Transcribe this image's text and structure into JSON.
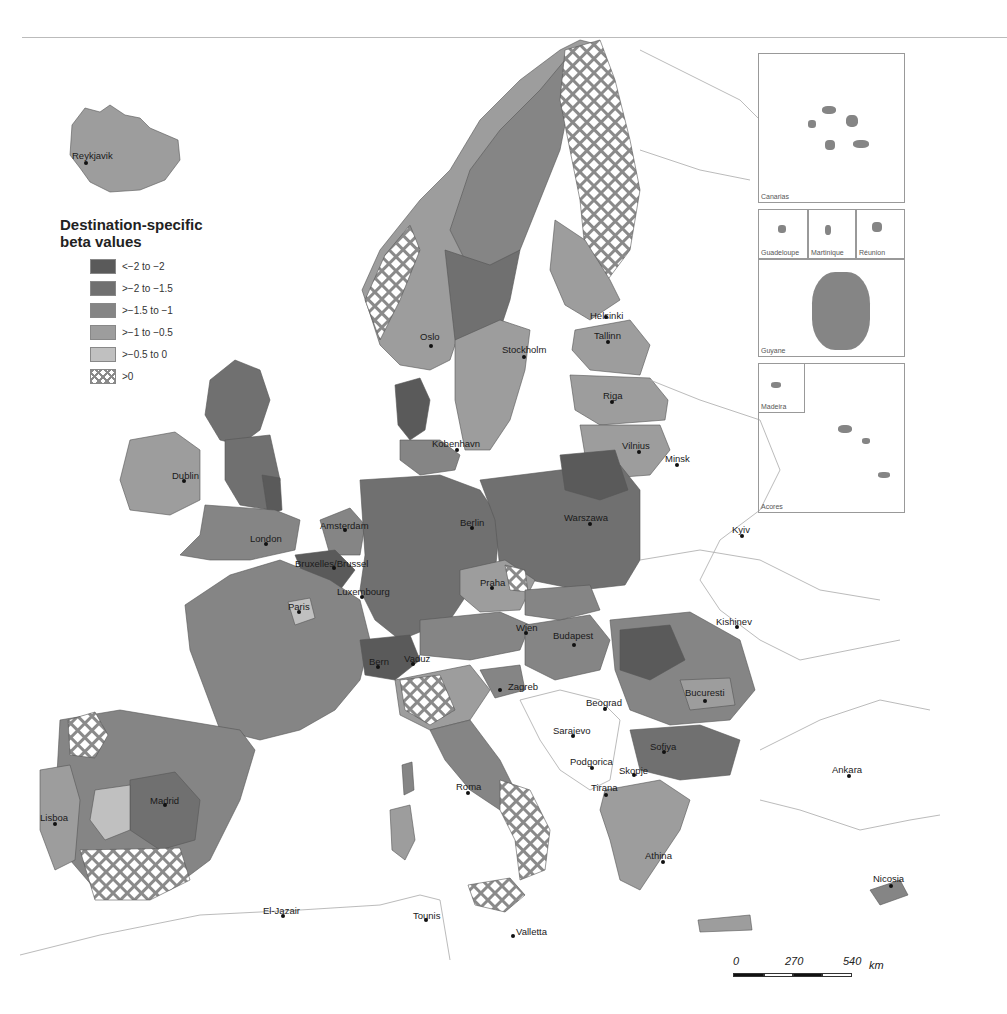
{
  "legend": {
    "title_line1": "Destination-specific",
    "title_line2": "beta values",
    "items": [
      {
        "label": "<−2 to −2",
        "color": "#5a5a5a"
      },
      {
        "label": ">−2 to −1.5",
        "color": "#707070"
      },
      {
        "label": ">−1.5 to −1",
        "color": "#858585"
      },
      {
        "label": ">−1 to −0.5",
        "color": "#9d9d9d"
      },
      {
        "label": ">−0.5 to 0",
        "color": "#c0c0c0"
      },
      {
        "label": ">0",
        "color": "crosshatch"
      }
    ]
  },
  "cities": [
    {
      "name": "Reykjavik",
      "x": 72,
      "y": 150,
      "dx": 86,
      "dy": 163
    },
    {
      "name": "Oslo",
      "x": 420,
      "y": 331,
      "dx": 431,
      "dy": 346
    },
    {
      "name": "Stockholm",
      "x": 502,
      "y": 344,
      "dx": 524,
      "dy": 357
    },
    {
      "name": "Helsinki",
      "x": 590,
      "y": 310,
      "dx": 606,
      "dy": 317
    },
    {
      "name": "Tallinn",
      "x": 594,
      "y": 330,
      "dx": 608,
      "dy": 342
    },
    {
      "name": "Riga",
      "x": 603,
      "y": 390,
      "dx": 612,
      "dy": 402
    },
    {
      "name": "Vilnius",
      "x": 622,
      "y": 440,
      "dx": 639,
      "dy": 452
    },
    {
      "name": "Minsk",
      "x": 665,
      "y": 453,
      "dx": 677,
      "dy": 465
    },
    {
      "name": "Kobenhavn",
      "x": 432,
      "y": 438,
      "dx": 457,
      "dy": 450
    },
    {
      "name": "Dublin",
      "x": 172,
      "y": 470,
      "dx": 184,
      "dy": 481
    },
    {
      "name": "London",
      "x": 250,
      "y": 533,
      "dx": 266,
      "dy": 544
    },
    {
      "name": "Amsterdam",
      "x": 320,
      "y": 520,
      "dx": 345,
      "dy": 530
    },
    {
      "name": "Berlin",
      "x": 460,
      "y": 517,
      "dx": 472,
      "dy": 528
    },
    {
      "name": "Warszawa",
      "x": 564,
      "y": 512,
      "dx": 590,
      "dy": 524
    },
    {
      "name": "Kyiv",
      "x": 732,
      "y": 524,
      "dx": 742,
      "dy": 536
    },
    {
      "name": "Bruxelles/Brussel",
      "x": 295,
      "y": 558,
      "dx": 334,
      "dy": 568
    },
    {
      "name": "Luxembourg",
      "x": 337,
      "y": 586,
      "dx": 362,
      "dy": 597
    },
    {
      "name": "Paris",
      "x": 288,
      "y": 601,
      "dx": 299,
      "dy": 612
    },
    {
      "name": "Praha",
      "x": 480,
      "y": 577,
      "dx": 492,
      "dy": 588
    },
    {
      "name": "Wien",
      "x": 516,
      "y": 622,
      "dx": 526,
      "dy": 633
    },
    {
      "name": "Budapest",
      "x": 553,
      "y": 630,
      "dx": 574,
      "dy": 645
    },
    {
      "name": "Kishinev",
      "x": 716,
      "y": 616,
      "dx": 737,
      "dy": 627
    },
    {
      "name": "Bern",
      "x": 369,
      "y": 656,
      "dx": 378,
      "dy": 667
    },
    {
      "name": "Vaduz",
      "x": 404,
      "y": 653,
      "dx": 413,
      "dy": 664
    },
    {
      "name": "Zagreb",
      "x": 508,
      "y": 681,
      "dx": 500,
      "dy": 690
    },
    {
      "name": "Beograd",
      "x": 586,
      "y": 697,
      "dx": 605,
      "dy": 709
    },
    {
      "name": "Bucuresti",
      "x": 685,
      "y": 687,
      "dx": 705,
      "dy": 701
    },
    {
      "name": "Sarajevo",
      "x": 553,
      "y": 725,
      "dx": 573,
      "dy": 736
    },
    {
      "name": "Sofiya",
      "x": 650,
      "y": 741,
      "dx": 664,
      "dy": 752
    },
    {
      "name": "Podgorica",
      "x": 570,
      "y": 756,
      "dx": 592,
      "dy": 768
    },
    {
      "name": "Skopje",
      "x": 619,
      "y": 765,
      "dx": 634,
      "dy": 775
    },
    {
      "name": "Tirana",
      "x": 591,
      "y": 782,
      "dx": 606,
      "dy": 795
    },
    {
      "name": "Roma",
      "x": 456,
      "y": 781,
      "dx": 468,
      "dy": 793
    },
    {
      "name": "Ankara",
      "x": 832,
      "y": 764,
      "dx": 849,
      "dy": 776
    },
    {
      "name": "Madrid",
      "x": 150,
      "y": 795,
      "dx": 165,
      "dy": 805
    },
    {
      "name": "Lisboa",
      "x": 40,
      "y": 812,
      "dx": 55,
      "dy": 824
    },
    {
      "name": "Athina",
      "x": 645,
      "y": 850,
      "dx": 663,
      "dy": 862
    },
    {
      "name": "Nicosia",
      "x": 873,
      "y": 873,
      "dx": 891,
      "dy": 886
    },
    {
      "name": "El-Jazair",
      "x": 263,
      "y": 905,
      "dx": 283,
      "dy": 916
    },
    {
      "name": "Tounis",
      "x": 413,
      "y": 910,
      "dx": 426,
      "dy": 920
    },
    {
      "name": "Valletta",
      "x": 516,
      "y": 926,
      "dx": 513,
      "dy": 936
    }
  ],
  "insets": [
    {
      "name": "Canarias",
      "x": 758,
      "y": 53,
      "w": 147,
      "h": 150
    },
    {
      "name": "Guadeloupe",
      "x": 758,
      "y": 209,
      "w": 50,
      "h": 50
    },
    {
      "name": "Martinique",
      "x": 808,
      "y": 209,
      "w": 48,
      "h": 50
    },
    {
      "name": "Réunion",
      "x": 856,
      "y": 209,
      "w": 49,
      "h": 50
    },
    {
      "name": "Guyane",
      "x": 758,
      "y": 259,
      "w": 147,
      "h": 98
    },
    {
      "name": "Madeira",
      "x": 758,
      "y": 363,
      "w": 47,
      "h": 50
    },
    {
      "name": "Acores",
      "x": 758,
      "y": 363,
      "w": 147,
      "h": 150
    }
  ],
  "scale": {
    "labels": [
      "0",
      "270",
      "540"
    ],
    "unit": "km"
  }
}
